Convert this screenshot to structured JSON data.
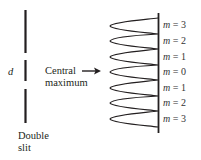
{
  "labels": {
    "slit_separation": "d",
    "central_max_line1": "Central",
    "central_max_line2": "maximum",
    "double_slit_line1": "Double",
    "double_slit_line2": "slit"
  },
  "orders": [
    {
      "var": "m",
      "value": "3"
    },
    {
      "var": "m",
      "value": "2"
    },
    {
      "var": "m",
      "value": "1"
    },
    {
      "var": "m",
      "value": "0"
    },
    {
      "var": "m",
      "value": "1"
    },
    {
      "var": "m",
      "value": "2"
    },
    {
      "var": "m",
      "value": "3"
    }
  ],
  "colors": {
    "ink": "#231f20"
  }
}
